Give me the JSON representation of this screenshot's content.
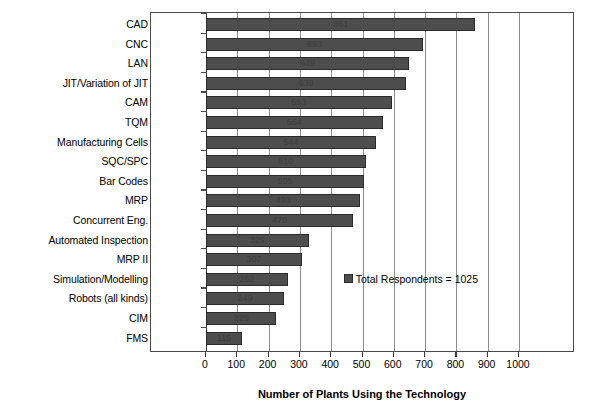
{
  "chart_data": {
    "type": "bar",
    "orientation": "horizontal",
    "title": "",
    "xlabel": "Number of Plants Using the Technology",
    "ylabel": "",
    "xlim": [
      0,
      1000
    ],
    "xticks": [
      0,
      100,
      200,
      300,
      400,
      500,
      600,
      700,
      800,
      900,
      1000
    ],
    "grid": true,
    "grid_axis": "x",
    "legend": {
      "position": "inside-right",
      "entries": [
        "Total Respondents = 1025"
      ]
    },
    "total_respondents": 1025,
    "bar_color": "#4d4d4d",
    "bar_edge_color": "#2b2b2b",
    "categories": [
      "CAD",
      "CNC",
      "LAN",
      "JIT/Variation of JIT",
      "CAM",
      "TQM",
      "Manufacturing Cells",
      "SQC/SPC",
      "Bar Codes",
      "MRP",
      "Concurrent Eng.",
      "Automated Inspection",
      "MRP II",
      "Simulation/Modelling",
      "Robots (all kinds)",
      "CIM",
      "FMS"
    ],
    "percent_labels": [
      "84.0%",
      "67.6%",
      "63.3%",
      "62.3%",
      "57.9%",
      "55.0%",
      "53.1%",
      "49.8%",
      "49.3%",
      "48.1%",
      "45.9%",
      "32.1%",
      "30.0%",
      "25.6%",
      "24.3%",
      "22.0%",
      "11.2%"
    ],
    "percents": [
      84.0,
      67.6,
      63.3,
      62.3,
      57.9,
      55.0,
      53.1,
      49.8,
      49.3,
      48.1,
      45.9,
      32.1,
      30.0,
      25.6,
      24.3,
      22.0,
      11.2
    ],
    "values": [
      861,
      693,
      649,
      639,
      593,
      564,
      544,
      510,
      505,
      493,
      470,
      329,
      307,
      262,
      249,
      225,
      115
    ],
    "value_labels": [
      "861",
      "693",
      "649",
      "639",
      "593",
      "564",
      "544",
      "510",
      "505",
      "493",
      "470",
      "329",
      "307",
      "262",
      "249",
      "225",
      "115"
    ]
  }
}
